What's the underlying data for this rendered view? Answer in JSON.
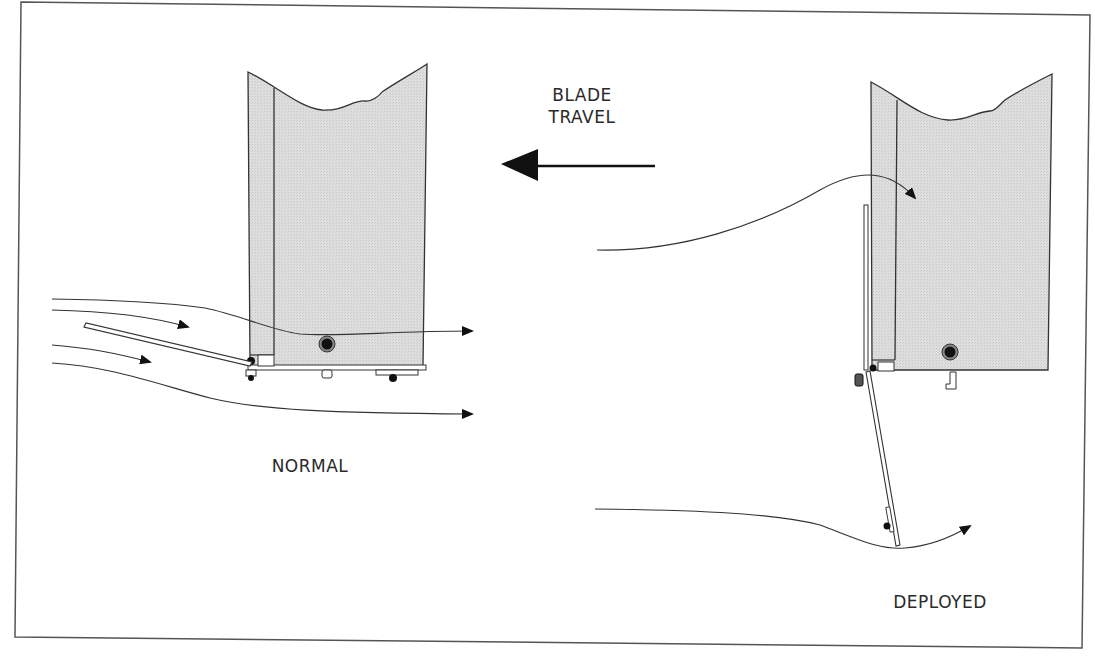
{
  "figure": {
    "labels": {
      "direction_line1": "BLADE",
      "direction_line2": "TRAVEL",
      "left_state": "NORMAL",
      "right_state": "DEPLOYED"
    },
    "colors": {
      "frame": "#555555",
      "blade_fill": "#dcdcdc",
      "stroke": "#333333",
      "arrow": "#111111"
    },
    "panels": [
      {
        "name": "normal",
        "flap_position": "retracted",
        "airflow": "passes beneath blade"
      },
      {
        "name": "deployed",
        "flap_position": "extended downward",
        "airflow": "deflected"
      }
    ]
  }
}
